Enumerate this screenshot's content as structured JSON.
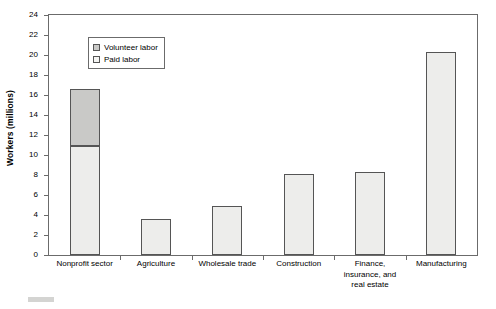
{
  "chart_data": {
    "type": "bar",
    "title": "",
    "subtitle": "",
    "xlabel": "",
    "ylabel": "Workers (millions)",
    "ylim": [
      0,
      24
    ],
    "ytick_step": 2,
    "yticks": [
      24,
      22,
      20,
      18,
      16,
      14,
      12,
      10,
      8,
      6,
      4,
      2,
      0
    ],
    "grid": false,
    "stacked": true,
    "legend_position": "top-left-inside",
    "categories": [
      "Nonprofit sector",
      "Agriculture",
      "Wholesale trade",
      "Construction",
      "Finance,\ninsurance, and\nreal estate",
      "Manufacturing"
    ],
    "series": [
      {
        "name": "Paid labor",
        "color": "#ededeb",
        "values": [
          10.9,
          3.6,
          4.9,
          8.1,
          8.3,
          20.3
        ]
      },
      {
        "name": "Volunteer labor",
        "color": "#c9c9c7",
        "values": [
          5.7,
          0,
          0,
          0,
          0,
          0
        ]
      }
    ],
    "totals": [
      16.6,
      3.6,
      4.9,
      8.1,
      8.3,
      20.3
    ],
    "annotations": []
  },
  "legend": {
    "items": [
      {
        "label": "Volunteer labor",
        "swatch": "volunteer"
      },
      {
        "label": "Paid labor",
        "swatch": "paid"
      }
    ]
  },
  "colors": {
    "volunteer": "#c9c9c7",
    "paid": "#ededeb",
    "axis": "#6b6b6b",
    "bar_outline": "#555555",
    "background": "#ffffff",
    "text": "#000000"
  }
}
